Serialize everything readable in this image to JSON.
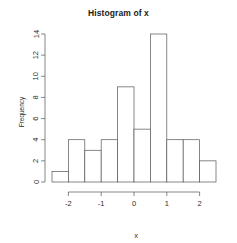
{
  "chart_data": {
    "type": "bar",
    "title": "Histogram of x",
    "xlabel": "x",
    "ylabel": "Frequency",
    "categories": [
      "[-2.5,-2)",
      "[-2,-1.5)",
      "[-1.5,-1)",
      "[-1,-0.5)",
      "[-0.5,0)",
      "[0,0.5)",
      "[0.5,1)",
      "[1,1.5)",
      "[1.5,2)",
      "[2,2.5)"
    ],
    "bin_edges": [
      -2.5,
      -2,
      -1.5,
      -1,
      -0.5,
      0,
      0.5,
      1,
      1.5,
      2,
      2.5
    ],
    "values": [
      1,
      4,
      3,
      4,
      9,
      5,
      14,
      4,
      4,
      2
    ],
    "bin_width": 0.5,
    "xlim": [
      -2.5,
      2.5
    ],
    "ylim": [
      0,
      14
    ],
    "xticks": [
      -2,
      -1,
      0,
      1,
      2
    ],
    "xtick_labels": [
      "-2",
      "-1",
      "0",
      "1",
      "2"
    ],
    "yticks": [
      0,
      2,
      4,
      6,
      8,
      10,
      12,
      14
    ],
    "ytick_labels": [
      "0",
      "2",
      "4",
      "6",
      "8",
      "10",
      "12",
      "14"
    ],
    "grid": false,
    "legend": null,
    "bar_fill": "#ffffff",
    "bar_stroke": "#555555"
  },
  "labels": {
    "title": "Histogram of x",
    "xaxis": "x",
    "yaxis": "Frequency"
  }
}
